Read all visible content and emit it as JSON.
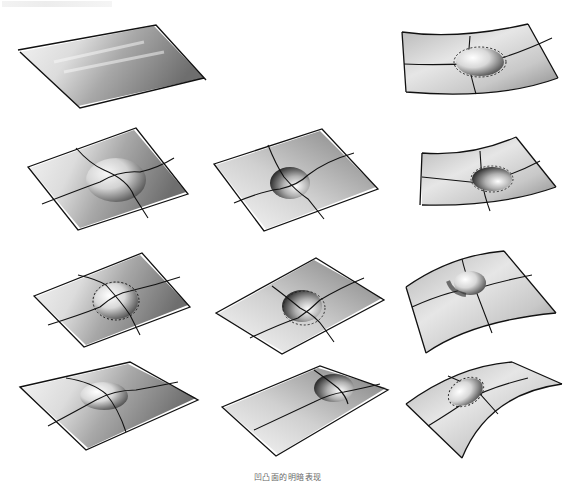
{
  "page": {
    "faded_header_text": "",
    "caption": "凹凸面的明暗表现"
  },
  "sketches": [
    {
      "id": "flat-plane",
      "row": 1,
      "col": 1,
      "surface": "flat",
      "feature": "none"
    },
    {
      "id": "curved-convex-top-right",
      "row": 1,
      "col": 3,
      "surface": "concave-curved",
      "feature": "bump"
    },
    {
      "id": "plane-bump-r2c1",
      "row": 2,
      "col": 1,
      "surface": "flat",
      "feature": "bump"
    },
    {
      "id": "plane-dent-r2c2",
      "row": 2,
      "col": 2,
      "surface": "flat",
      "feature": "dent"
    },
    {
      "id": "curved-dent-r2c3",
      "row": 2,
      "col": 3,
      "surface": "concave-curved",
      "feature": "dent"
    },
    {
      "id": "plane-bump-r3c1",
      "row": 3,
      "col": 1,
      "surface": "flat",
      "feature": "bump-outlined"
    },
    {
      "id": "plane-dent-r3c2",
      "row": 3,
      "col": 2,
      "surface": "flat",
      "feature": "dent"
    },
    {
      "id": "curved-bump-r3c3",
      "row": 3,
      "col": 3,
      "surface": "convex-curved",
      "feature": "bump"
    },
    {
      "id": "plane-bump-r4c1",
      "row": 4,
      "col": 1,
      "surface": "flat",
      "feature": "bump"
    },
    {
      "id": "plane-dent-r4c2",
      "row": 4,
      "col": 2,
      "surface": "flat",
      "feature": "dent"
    },
    {
      "id": "curved-bump-r4c3",
      "row": 4,
      "col": 3,
      "surface": "convex-curved",
      "feature": "bump"
    }
  ]
}
